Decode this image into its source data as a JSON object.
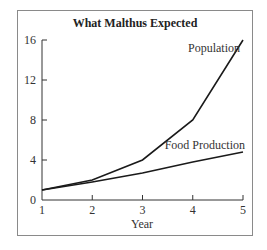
{
  "chart_data": {
    "type": "line",
    "title": "What Malthus Expected",
    "xlabel": "Year",
    "ylabel": "",
    "x": [
      1,
      2,
      3,
      4,
      5
    ],
    "xticks": [
      "1",
      "2",
      "3",
      "4",
      "5"
    ],
    "yticks": [
      "0",
      "4",
      "8",
      "12",
      "16"
    ],
    "ylim": [
      0,
      16
    ],
    "xlim": [
      1,
      5
    ],
    "grid": false,
    "legend": "inline labels",
    "series": [
      {
        "name": "Population",
        "values": [
          1,
          2,
          4,
          8,
          16
        ]
      },
      {
        "name": "Food Production",
        "values": [
          1,
          1.8,
          2.7,
          3.8,
          4.8
        ]
      }
    ]
  }
}
